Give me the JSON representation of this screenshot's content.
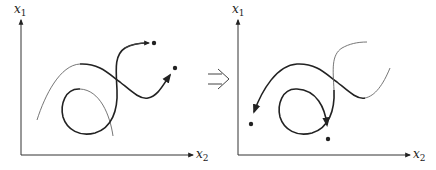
{
  "figure": {
    "transition_symbol": "implies-arrow",
    "colors": {
      "stroke": "#222222",
      "light_stroke": "#555555",
      "background": "#ffffff"
    },
    "left_panel": {
      "y_axis_label": {
        "var": "x",
        "sub": "1"
      },
      "x_axis_label": {
        "var": "x",
        "sub": "2"
      },
      "description": "Two trajectories with forward arrows ending at dots (upper right)"
    },
    "right_panel": {
      "y_axis_label": {
        "var": "x",
        "sub": "1"
      },
      "x_axis_label": {
        "var": "x",
        "sub": "2"
      },
      "description": "Same curves traversed in reverse, arrows ending at dots (lower left)"
    }
  }
}
